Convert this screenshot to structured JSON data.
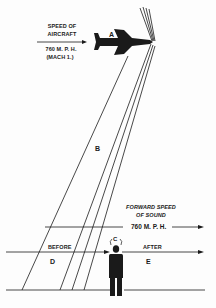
{
  "diagram": {
    "aircraft": {
      "label_line1": "SPEED OF",
      "label_line2": "AIRCRAFT",
      "speed": "760 M. P. H.",
      "mach": "(MACH 1.)",
      "marker": "A"
    },
    "shock_region_marker": "B",
    "observer_marker": "C",
    "sound": {
      "label_line1": "FORWARD SPEED",
      "label_line2": "OF SOUND",
      "speed": "760 M. P. H."
    },
    "before_label": "BEFORE",
    "after_label": "AFTER",
    "before_marker": "D",
    "after_marker": "E",
    "colors": {
      "ink": "#1a1a1a",
      "background": "#fdfdfd"
    }
  }
}
